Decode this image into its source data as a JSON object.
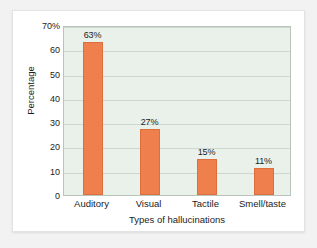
{
  "figure": {
    "card_background": "#ffffff",
    "page_background": "#f2f2f2"
  },
  "chart_data": {
    "type": "bar",
    "title": "",
    "subtitle": "",
    "xlabel": "Types of hallucinations",
    "ylabel": "Percentage",
    "categories": [
      "Auditory",
      "Visual",
      "Tactile",
      "Smell/taste"
    ],
    "values": [
      63,
      27,
      15,
      11
    ],
    "data_labels": [
      "63%",
      "27%",
      "15%",
      "11%"
    ],
    "ylim": [
      0,
      70
    ],
    "ytick_values": [
      0,
      10,
      20,
      30,
      40,
      50,
      60,
      70
    ],
    "ytick_labels": [
      "0",
      "10",
      "20",
      "30",
      "40",
      "50",
      "60",
      "70%"
    ],
    "grid": "horizontal",
    "legend": "none",
    "bar_color": "#f07f4e",
    "bar_edge_color": "#dd6f3f",
    "plot_background": "#e9f1ea",
    "gridline_color": "#ccd8cd",
    "axis_border_color": "#b9c4ba"
  }
}
